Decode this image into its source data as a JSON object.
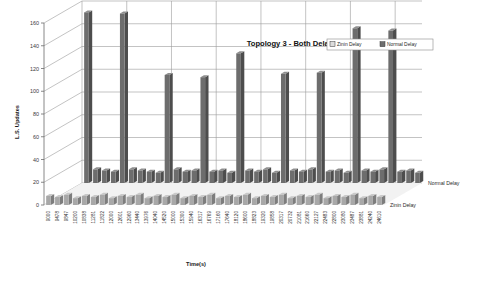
{
  "chart_data": {
    "type": "bar",
    "title": "Topology 3 - Both Delays",
    "xlabel": "Time(s)",
    "ylabel": "L.S. Updates",
    "ylim": [
      0,
      160
    ],
    "yticks": [
      0,
      20,
      40,
      60,
      80,
      100,
      120,
      140,
      160
    ],
    "grid": true,
    "legend_position": "top-right",
    "depth_labels": [
      "Normal Delay",
      "Zinin Delay"
    ],
    "categories": [
      "9000",
      "9478",
      "9847",
      "10200",
      "10838",
      "11281",
      "11822",
      "12000",
      "12601",
      "12960",
      "13440",
      "13976",
      "14040",
      "14520",
      "15000",
      "15300",
      "15940",
      "16317",
      "16769",
      "17160",
      "17640",
      "18120",
      "18600",
      "18823",
      "19320",
      "19858",
      "20317",
      "20732",
      "21081",
      "21660",
      "22127",
      "22483",
      "22800",
      "23080",
      "23487",
      "23881",
      "24240",
      "24610"
    ],
    "series": [
      {
        "name": "Zinin Delay",
        "values": [
          8,
          7,
          9,
          6,
          8,
          7,
          9,
          6,
          8,
          7,
          9,
          6,
          8,
          7,
          9,
          6,
          8,
          7,
          9,
          6,
          8,
          7,
          9,
          6,
          8,
          7,
          9,
          6,
          8,
          7,
          9,
          6,
          8,
          7,
          9,
          6,
          8,
          7
        ]
      },
      {
        "name": "Normal Delay",
        "values": [
          150,
          12,
          11,
          10,
          149,
          12,
          11,
          10,
          9,
          95,
          12,
          10,
          11,
          93,
          10,
          11,
          9,
          114,
          11,
          10,
          12,
          9,
          96,
          11,
          10,
          12,
          97,
          10,
          11,
          9,
          136,
          11,
          10,
          12,
          134,
          10,
          11,
          9
        ]
      }
    ]
  },
  "legend": {
    "entries": [
      {
        "label": "Zinin Delay",
        "color": "#dcdcdc"
      },
      {
        "label": "Normal Delay",
        "color": "#6d6d6d"
      }
    ]
  }
}
